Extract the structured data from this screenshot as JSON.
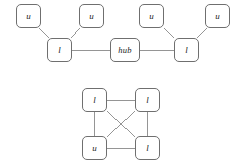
{
  "figure": {
    "width": 239,
    "height": 168,
    "background": "#ffffff",
    "node_border_color": "#6f6f6f",
    "edge_color": "#8a8a8a",
    "label_color": "#1a1a1a"
  },
  "graphs": [
    {
      "id": "hub-topology",
      "name": "hub-star-graph",
      "nodes": [
        {
          "id": "t-u1",
          "label": "u",
          "x": 16,
          "y": 4,
          "w": 25,
          "h": 24
        },
        {
          "id": "t-u2",
          "label": "u",
          "x": 79,
          "y": 4,
          "w": 25,
          "h": 24
        },
        {
          "id": "t-u3",
          "label": "u",
          "x": 139,
          "y": 4,
          "w": 25,
          "h": 24
        },
        {
          "id": "t-u4",
          "label": "u",
          "x": 205,
          "y": 4,
          "w": 25,
          "h": 24
        },
        {
          "id": "t-l1",
          "label": "l",
          "x": 47,
          "y": 38,
          "w": 25,
          "h": 24
        },
        {
          "id": "t-hub",
          "label": "hub",
          "x": 110,
          "y": 38,
          "w": 30,
          "h": 24
        },
        {
          "id": "t-l2",
          "label": "l",
          "x": 174,
          "y": 38,
          "w": 25,
          "h": 24
        }
      ],
      "edges": [
        {
          "from": "t-u1",
          "to": "t-l1"
        },
        {
          "from": "t-u2",
          "to": "t-l1"
        },
        {
          "from": "t-l1",
          "to": "t-hub"
        },
        {
          "from": "t-hub",
          "to": "t-l2"
        },
        {
          "from": "t-u3",
          "to": "t-l2"
        },
        {
          "from": "t-u4",
          "to": "t-l2"
        }
      ]
    },
    {
      "id": "complete-graph",
      "name": "k4-complete-graph",
      "nodes": [
        {
          "id": "b-l1",
          "label": "l",
          "x": 82,
          "y": 88,
          "w": 25,
          "h": 24
        },
        {
          "id": "b-l2",
          "label": "l",
          "x": 135,
          "y": 88,
          "w": 25,
          "h": 24
        },
        {
          "id": "b-u1",
          "label": "u",
          "x": 82,
          "y": 136,
          "w": 25,
          "h": 24
        },
        {
          "id": "b-l3",
          "label": "l",
          "x": 135,
          "y": 136,
          "w": 25,
          "h": 24
        }
      ],
      "edges": [
        {
          "from": "b-l1",
          "to": "b-l2"
        },
        {
          "from": "b-l1",
          "to": "b-u1"
        },
        {
          "from": "b-l2",
          "to": "b-l3"
        },
        {
          "from": "b-u1",
          "to": "b-l3"
        },
        {
          "from": "b-l1",
          "to": "b-l3"
        },
        {
          "from": "b-l2",
          "to": "b-u1"
        }
      ]
    }
  ]
}
